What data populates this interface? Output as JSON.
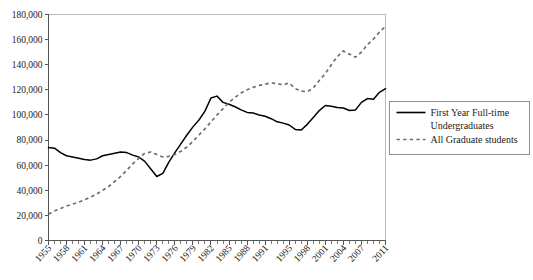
{
  "chart_data": {
    "type": "line",
    "title": "",
    "xlabel": "",
    "ylabel": "",
    "grid": false,
    "legend_position": "right",
    "ylim": [
      0,
      180000
    ],
    "xlim": [
      1955,
      2011
    ],
    "ytick_labels": [
      "0",
      "20,000",
      "40,000",
      "60,000",
      "80,000",
      "100,000",
      "120,000",
      "140,000",
      "160,000",
      "180,000"
    ],
    "ytick_values": [
      0,
      20000,
      40000,
      60000,
      80000,
      100000,
      120000,
      140000,
      160000,
      180000
    ],
    "xtick_labels": [
      "1955",
      "1958",
      "1961",
      "1964",
      "1967",
      "1970",
      "1973",
      "1976",
      "1979",
      "1982",
      "1985",
      "1988",
      "1991",
      "1995",
      "1998",
      "2001",
      "2004",
      "2007",
      "2011"
    ],
    "xtick_values": [
      1955,
      1958,
      1961,
      1964,
      1967,
      1970,
      1973,
      1976,
      1979,
      1982,
      1985,
      1988,
      1991,
      1995,
      1998,
      2001,
      2004,
      2007,
      2011
    ],
    "x": [
      1955,
      1956,
      1957,
      1958,
      1959,
      1960,
      1961,
      1962,
      1963,
      1964,
      1965,
      1966,
      1967,
      1968,
      1969,
      1970,
      1971,
      1972,
      1973,
      1974,
      1975,
      1976,
      1977,
      1978,
      1979,
      1980,
      1981,
      1982,
      1983,
      1984,
      1985,
      1986,
      1987,
      1988,
      1989,
      1990,
      1991,
      1992,
      1993,
      1994,
      1995,
      1996,
      1997,
      1998,
      1999,
      2000,
      2001,
      2002,
      2003,
      2004,
      2005,
      2006,
      2007,
      2008,
      2009,
      2010,
      2011
    ],
    "series": [
      {
        "name": "First Year Full-time Undergraduates",
        "style": "solid",
        "color": "#000000",
        "values": [
          74000,
          73500,
          70000,
          67500,
          66500,
          65500,
          64500,
          64000,
          65000,
          67500,
          68500,
          69500,
          70500,
          70000,
          68000,
          66500,
          63000,
          57000,
          51000,
          53500,
          62500,
          70000,
          77000,
          84000,
          90500,
          96000,
          103000,
          113500,
          115000,
          110000,
          108500,
          106500,
          104000,
          102000,
          101500,
          100000,
          99000,
          97000,
          94500,
          93500,
          92000,
          88500,
          88000,
          92500,
          98000,
          103500,
          107500,
          107000,
          106000,
          105500,
          103500,
          104000,
          110000,
          113000,
          112500,
          118000,
          121000
        ]
      },
      {
        "name": "All Graduate students",
        "style": "dashed",
        "color": "#6e6e6e",
        "values": [
          21000,
          23500,
          25500,
          27500,
          29000,
          30500,
          32500,
          34500,
          37000,
          40000,
          43000,
          47000,
          51000,
          56000,
          61000,
          65500,
          69500,
          70500,
          68500,
          66500,
          67000,
          68500,
          71000,
          74500,
          79000,
          84000,
          89000,
          94500,
          100000,
          105000,
          110000,
          114000,
          117500,
          120000,
          122000,
          123500,
          124500,
          125500,
          125000,
          124000,
          125500,
          121000,
          119000,
          118500,
          121500,
          127500,
          133000,
          140000,
          146500,
          151000,
          148500,
          146000,
          150000,
          156000,
          160500,
          166000,
          170500
        ]
      }
    ],
    "legend_entries": [
      {
        "label_line1": "First Year Full-time",
        "label_line2": "Undergraduates",
        "style": "solid"
      },
      {
        "label_line1": "All Graduate students",
        "label_line2": "",
        "style": "dashed"
      }
    ]
  },
  "colors": {
    "background": "#ffffff",
    "axis": "#555555",
    "frame": "#b9b9b9",
    "solid_series": "#000000",
    "dashed_series": "#6e6e6e",
    "text": "#1a1a1a",
    "legend_border": "#8d8d8d"
  }
}
